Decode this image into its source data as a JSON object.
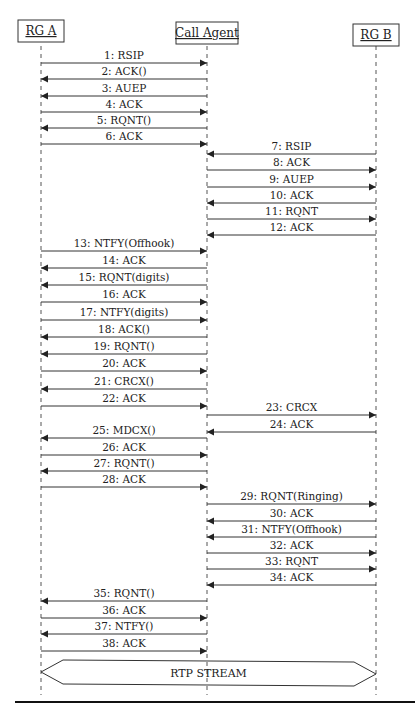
{
  "diagram": {
    "type": "sequence",
    "actors": [
      {
        "id": "rga",
        "label": "RG A"
      },
      {
        "id": "ca",
        "label": "Call Agent"
      },
      {
        "id": "rgb",
        "label": "RG B"
      }
    ],
    "messages": [
      {
        "from": "rga",
        "to": "ca",
        "label": "1: RSIP"
      },
      {
        "from": "ca",
        "to": "rga",
        "label": "2: ACK()"
      },
      {
        "from": "ca",
        "to": "rga",
        "label": "3: AUEP"
      },
      {
        "from": "rga",
        "to": "ca",
        "label": "4: ACK"
      },
      {
        "from": "ca",
        "to": "rga",
        "label": "5: RQNT()"
      },
      {
        "from": "rga",
        "to": "ca",
        "label": "6: ACK"
      },
      {
        "from": "rgb",
        "to": "ca",
        "label": "7: RSIP"
      },
      {
        "from": "ca",
        "to": "rgb",
        "label": "8: ACK"
      },
      {
        "from": "ca",
        "to": "rgb",
        "label": "9: AUEP"
      },
      {
        "from": "rgb",
        "to": "ca",
        "label": "10: ACK"
      },
      {
        "from": "ca",
        "to": "rgb",
        "label": "11: RQNT"
      },
      {
        "from": "rgb",
        "to": "ca",
        "label": "12: ACK"
      },
      {
        "from": "rga",
        "to": "ca",
        "label": "13: NTFY(Offhook)"
      },
      {
        "from": "ca",
        "to": "rga",
        "label": "14: ACK"
      },
      {
        "from": "ca",
        "to": "rga",
        "label": "15: RQNT(digits)"
      },
      {
        "from": "rga",
        "to": "ca",
        "label": "16: ACK"
      },
      {
        "from": "rga",
        "to": "ca",
        "label": "17: NTFY(digits)"
      },
      {
        "from": "ca",
        "to": "rga",
        "label": "18: ACK()"
      },
      {
        "from": "ca",
        "to": "rga",
        "label": "19: RQNT()"
      },
      {
        "from": "rga",
        "to": "ca",
        "label": "20: ACK"
      },
      {
        "from": "ca",
        "to": "rga",
        "label": "21: CRCX()"
      },
      {
        "from": "rga",
        "to": "ca",
        "label": "22: ACK"
      },
      {
        "from": "ca",
        "to": "rgb",
        "label": "23: CRCX"
      },
      {
        "from": "rgb",
        "to": "ca",
        "label": "24: ACK"
      },
      {
        "from": "ca",
        "to": "rga",
        "label": "25: MDCX()"
      },
      {
        "from": "rga",
        "to": "ca",
        "label": "26: ACK"
      },
      {
        "from": "ca",
        "to": "rga",
        "label": "27: RQNT()"
      },
      {
        "from": "rga",
        "to": "ca",
        "label": "28: ACK"
      },
      {
        "from": "ca",
        "to": "rgb",
        "label": "29: RQNT(Ringing)"
      },
      {
        "from": "rgb",
        "to": "ca",
        "label": "30: ACK"
      },
      {
        "from": "rgb",
        "to": "ca",
        "label": "31: NTFY(Offhook)"
      },
      {
        "from": "ca",
        "to": "rgb",
        "label": "32: ACK"
      },
      {
        "from": "ca",
        "to": "rgb",
        "label": "33: RQNT"
      },
      {
        "from": "rgb",
        "to": "ca",
        "label": "34: ACK"
      },
      {
        "from": "ca",
        "to": "rga",
        "label": "35: RQNT()"
      },
      {
        "from": "rga",
        "to": "ca",
        "label": "36: ACK"
      },
      {
        "from": "ca",
        "to": "rga",
        "label": "37: NTFY()"
      },
      {
        "from": "rga",
        "to": "ca",
        "label": "38: ACK"
      }
    ],
    "stream": {
      "from": "rga",
      "to": "rgb",
      "label": "RTP STREAM"
    },
    "colors": {
      "line": "#333333",
      "text": "#222222",
      "background": "#ffffff"
    }
  }
}
